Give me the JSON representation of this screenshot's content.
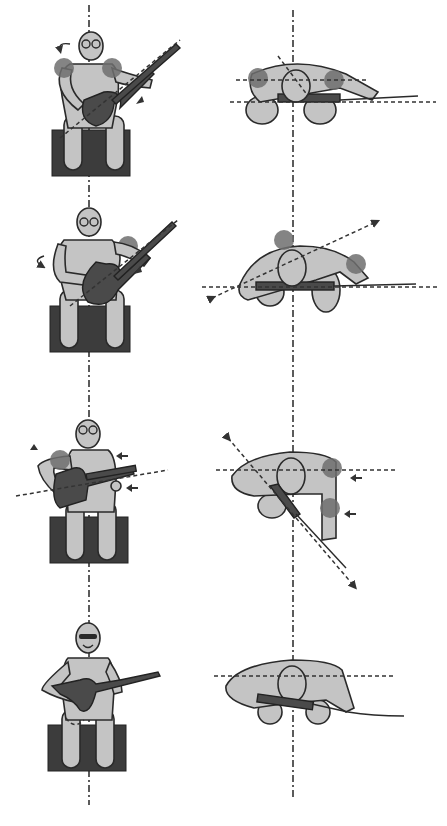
{
  "figure": {
    "type": "posture-diagram",
    "layout": {
      "rows": 4,
      "columns": 2,
      "column_views": [
        "front-view",
        "top-view"
      ]
    },
    "colors": {
      "body_fill": "#c4c4c4",
      "outline": "#2a2a2a",
      "guitar": "#4a4a4a",
      "seat": "#3c3c3c",
      "joint_highlight": "#6e6e6e",
      "axis_lines": "#333333",
      "background": "#ffffff"
    },
    "panels": [
      {
        "row": 1,
        "front": {
          "face": "glasses",
          "annotations": [
            "rotation-arrow-left",
            "shoulder-highlights",
            "wrist-arrow"
          ]
        },
        "top": {
          "annotations": [
            "shoulder-highlights",
            "tilted-axis",
            "horizontal-guides"
          ]
        }
      },
      {
        "row": 2,
        "front": {
          "face": "glasses",
          "annotations": [
            "rotation-arrow-left",
            "right-shoulder-highlight",
            "wrist-arrow"
          ]
        },
        "top": {
          "annotations": [
            "shoulder-highlight",
            "elbow-highlight",
            "diagonal-axis-arrows"
          ]
        }
      },
      {
        "row": 3,
        "front": {
          "face": "glasses",
          "annotations": [
            "up-arrow",
            "left-arm-highlight",
            "push-arrows-left",
            "tilted-guitar-line"
          ]
        },
        "top": {
          "annotations": [
            "shoulder-highlight",
            "elbow-highlight",
            "push-arrows-left",
            "diagonal-axis-arrows"
          ]
        }
      },
      {
        "row": 4,
        "front": {
          "face": "sunglasses-smile",
          "annotations": []
        },
        "top": {
          "annotations": [
            "horizontal-guide"
          ]
        }
      }
    ]
  }
}
